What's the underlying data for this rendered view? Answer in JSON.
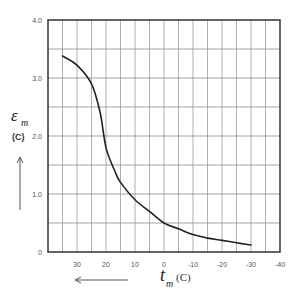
{
  "chart_data": {
    "type": "line",
    "title": "",
    "xlabel": "t_m (C)",
    "ylabel": "ε_m (C)",
    "x_symbol": "t",
    "x_subscript": "m",
    "x_unit": "(C)",
    "y_symbol": "ε",
    "y_subscript": "m",
    "y_unit": "(C)",
    "xlim": [
      40,
      -40
    ],
    "ylim": [
      0,
      4.0
    ],
    "x_reversed": true,
    "grid": true,
    "x_ticks": [
      30,
      20,
      10,
      0,
      -10,
      -20,
      -30,
      -40
    ],
    "x_tick_labels": [
      "30",
      "20",
      "10",
      "0",
      "-10",
      "-20",
      "-30",
      "-40"
    ],
    "y_ticks": [
      0,
      1.0,
      2.0,
      3.0,
      4.0
    ],
    "y_tick_labels": [
      "0",
      "1.0",
      "2.0",
      "3.0",
      "4.0"
    ],
    "x_grid_step": 5,
    "y_grid_step": 0.5,
    "series": [
      {
        "name": "ε_m vs t_m",
        "color": "#222222",
        "x": [
          35,
          30,
          25,
          22,
          20,
          17,
          15,
          10,
          5,
          0,
          -5,
          -10,
          -15,
          -20,
          -25,
          -30
        ],
        "y": [
          3.38,
          3.22,
          2.9,
          2.4,
          1.8,
          1.4,
          1.2,
          0.9,
          0.7,
          0.5,
          0.4,
          0.3,
          0.24,
          0.2,
          0.16,
          0.12
        ]
      }
    ],
    "annotations": [
      "arrow pointing up beside y-axis label",
      "arrow pointing left below x-axis ticks"
    ]
  }
}
